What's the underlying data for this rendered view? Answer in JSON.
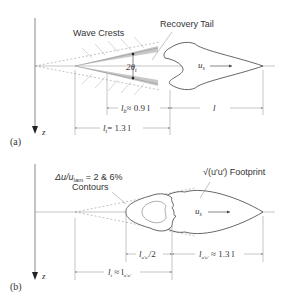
{
  "panel_a": {
    "tag": "(a)",
    "axis_label": "z",
    "wave_crests_label": "Wave Crests",
    "recovery_tail_label": "Recovery Tail",
    "angle_label": "2θ",
    "angle_sub": "t",
    "speed_label": "u",
    "speed_sub": "s",
    "dim_lt": "l",
    "dim_lb_label": "l",
    "dim_lb_sub": "b",
    "dim_lb_value": "≈ 0.9 l",
    "dim_lt_label": "l",
    "dim_lt_sub": "t",
    "dim_lt_value": "= 1.3 l"
  },
  "panel_b": {
    "tag": "(b)",
    "axis_label": "z",
    "contours_label_line1": "Δu/u",
    "contours_label_sub": "lam",
    "contours_label_rest": " = 2 & 6%",
    "contours_label_line2": "Contours",
    "footprint_label": "√(u′u′) Footprint",
    "speed_label": "u",
    "speed_sub": "s",
    "dim_half": "l",
    "dim_half_sub": "u′u′",
    "dim_half_rest": "/2",
    "dim_body": "l",
    "dim_body_sub": "u′u′",
    "dim_body_rest": " ≈ 1.3 l",
    "dim_total": "l",
    "dim_total_sub": "t",
    "dim_total_rest": " ≈ l",
    "dim_total_sub2": "u′u′"
  }
}
